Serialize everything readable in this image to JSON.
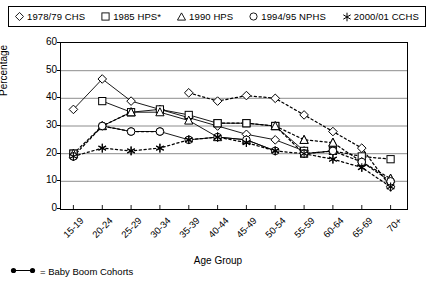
{
  "legend": {
    "items": [
      {
        "marker": "diamond",
        "label": "1978/79 CHS"
      },
      {
        "marker": "square",
        "label": "1985 HPS*"
      },
      {
        "marker": "triangle",
        "label": "1990 HPS"
      },
      {
        "marker": "circle",
        "label": "1994/95 NPHS"
      },
      {
        "marker": "star",
        "label": "2000/01 CCHS"
      }
    ]
  },
  "footnote": {
    "text": "= Baby Boom Cohorts"
  },
  "chart_data": {
    "type": "line",
    "title": "",
    "xlabel": "Age Group",
    "ylabel": "Percentage",
    "ylim": [
      0,
      60
    ],
    "yticks": [
      0,
      10,
      20,
      30,
      40,
      50,
      60
    ],
    "grid": true,
    "legend_position": "top",
    "categories": [
      "15-19",
      "20-24",
      "25-29",
      "30-34",
      "35-39",
      "40-44",
      "45-49",
      "50-54",
      "55-59",
      "60-64",
      "65-69",
      "70+"
    ],
    "series": [
      {
        "name": "1978/79 CHS",
        "marker": "diamond",
        "values": [
          36,
          47,
          39,
          36,
          33,
          30,
          27,
          25,
          21,
          null,
          null,
          null
        ]
      },
      {
        "name": "1985 HPS*",
        "marker": "square",
        "values": [
          20,
          39,
          35,
          36,
          34,
          31,
          31,
          30,
          21,
          null,
          null,
          null
        ]
      },
      {
        "name": "1990 HPS",
        "marker": "triangle",
        "values": [
          20,
          30,
          35,
          35,
          32,
          26,
          25,
          30,
          25,
          24,
          17,
          11
        ]
      },
      {
        "name": "1994/95 NPHS",
        "marker": "circle",
        "values": [
          19,
          30,
          28,
          28,
          25,
          26,
          25,
          21,
          20,
          21,
          17,
          10
        ]
      },
      {
        "name": "2000/01 CCHS",
        "marker": "star",
        "values": [
          19,
          22,
          21,
          22,
          25,
          26,
          24,
          21,
          20,
          18,
          15,
          8
        ]
      }
    ],
    "dotted_series": [
      {
        "name": "1978/79 CHS-trace",
        "marker": "diamond",
        "values": [
          null,
          null,
          null,
          null,
          42,
          39,
          41,
          40,
          34,
          28,
          22,
          8
        ]
      },
      {
        "name": "1985 HPS-trace",
        "marker": "square",
        "values": [
          20,
          null,
          null,
          null,
          null,
          31,
          31,
          30,
          20,
          21,
          19,
          18
        ]
      },
      {
        "name": "1990 HPS-trace",
        "marker": "triangle",
        "values": [
          20,
          30,
          35,
          null,
          null,
          null,
          null,
          30,
          25,
          24,
          17,
          11
        ]
      },
      {
        "name": "1994/95 NPHS-trace",
        "marker": "circle",
        "values": [
          19,
          30,
          28,
          28,
          null,
          null,
          null,
          null,
          20,
          21,
          17,
          10
        ]
      },
      {
        "name": "2000/01 CCHS-trace",
        "marker": "star",
        "values": [
          19,
          22,
          21,
          22,
          25,
          26,
          24,
          21,
          20,
          18,
          15,
          8
        ]
      }
    ],
    "cohort_lines": [
      {
        "from_series": "1978/79 CHS",
        "points": [
          [
            0,
            36
          ],
          [
            1,
            47
          ],
          [
            2,
            39
          ],
          [
            3,
            36
          ],
          [
            4,
            33
          ],
          [
            5,
            30
          ],
          [
            6,
            27
          ],
          [
            7,
            25
          ],
          [
            8,
            21
          ]
        ]
      },
      {
        "from_series": "1985 HPS*",
        "points": [
          [
            1,
            39
          ],
          [
            2,
            35
          ],
          [
            3,
            36
          ],
          [
            4,
            34
          ],
          [
            5,
            31
          ],
          [
            6,
            31
          ],
          [
            7,
            30
          ],
          [
            8,
            21
          ]
        ]
      },
      {
        "from_series": "1990 HPS",
        "points": [
          [
            1,
            30
          ],
          [
            2,
            35
          ],
          [
            3,
            35
          ],
          [
            4,
            32
          ],
          [
            5,
            26
          ],
          [
            6,
            25
          ],
          [
            7,
            21
          ]
        ]
      },
      {
        "from_series": "1994/95 NPHS",
        "points": [
          [
            1,
            30
          ],
          [
            2,
            28
          ],
          [
            3,
            28
          ],
          [
            4,
            25
          ],
          [
            5,
            26
          ],
          [
            6,
            25
          ],
          [
            7,
            21
          ]
        ]
      }
    ]
  }
}
